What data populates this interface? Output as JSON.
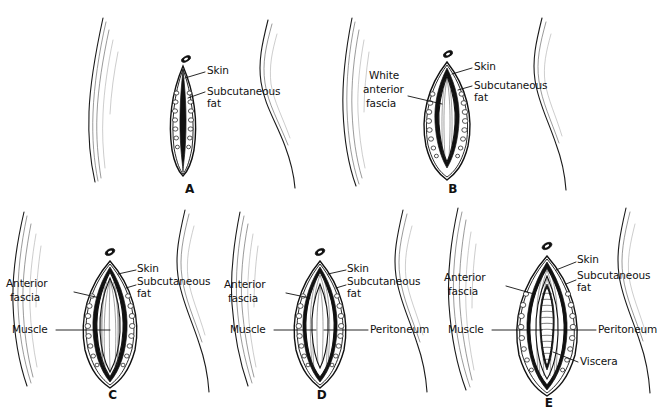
{
  "figure": {
    "background_color": "#ffffff",
    "ink_color": "#111111",
    "panel_count": 5
  },
  "labels": {
    "skin": "Skin",
    "subcutaneous": "Subcutaneous",
    "fat": "fat",
    "white": "White",
    "anterior": "anterior",
    "fascia_word": "fascia",
    "anterior_word": "Anterior",
    "muscle": "Muscle",
    "peritoneum": "Peritoneum",
    "viscera": "Viscera"
  },
  "panels": [
    {
      "letter": "A",
      "caption": "Skin incision with subcutaneous fat exposed",
      "labels_right": [
        "Skin",
        "Subcutaneous",
        "fat"
      ],
      "labels_left": [],
      "layers_shown": [
        "skin",
        "subcutaneous fat"
      ]
    },
    {
      "letter": "B",
      "caption": "White anterior fascia exposed beneath the fat",
      "labels_right": [
        "Skin",
        "Subcutaneous",
        "fat"
      ],
      "labels_left": [
        "White",
        "anterior",
        "fascia"
      ],
      "layers_shown": [
        "skin",
        "subcutaneous fat",
        "white anterior fascia"
      ]
    },
    {
      "letter": "C",
      "caption": "Muscle exposed after fascia is divided",
      "labels_right": [
        "Skin",
        "Subcutaneous",
        "fat"
      ],
      "labels_left": [
        "Anterior",
        "fascia",
        "Muscle"
      ],
      "layers_shown": [
        "skin",
        "subcutaneous fat",
        "anterior fascia",
        "muscle"
      ]
    },
    {
      "letter": "D",
      "caption": "Peritoneum exposed after muscle is separated",
      "labels_right": [
        "Skin",
        "Subcutaneous",
        "fat",
        "Peritoneum"
      ],
      "labels_left": [
        "Anterior",
        "fascia",
        "Muscle"
      ],
      "layers_shown": [
        "skin",
        "subcutaneous fat",
        "anterior fascia",
        "muscle",
        "peritoneum"
      ]
    },
    {
      "letter": "E",
      "caption": "Viscera exposed after peritoneum is opened",
      "labels_right": [
        "Skin",
        "Subcutaneous",
        "fat",
        "Peritoneum",
        "Viscera"
      ],
      "labels_left": [
        "Anterior",
        "fascia",
        "Muscle"
      ],
      "layers_shown": [
        "skin",
        "subcutaneous fat",
        "anterior fascia",
        "muscle",
        "peritoneum",
        "viscera"
      ]
    }
  ]
}
